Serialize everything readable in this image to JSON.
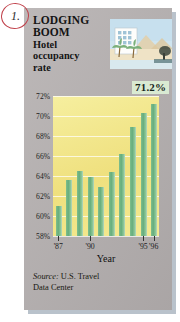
{
  "annotation": {
    "label": "1."
  },
  "headline": {
    "line1": "LODGING",
    "line2": "BOOM",
    "sub1": "Hotel",
    "sub2": "occupancy",
    "sub3": "rate"
  },
  "illustration": {
    "name": "hotel-beach-resort-illustration",
    "alt": "Hotel building with palm trees and beach"
  },
  "callout": {
    "value": "71.2%"
  },
  "source": {
    "prefix": "Source:",
    "line1": "U.S. Travel",
    "line2": "Data Center"
  },
  "colors": {
    "panel_background": "#b3aeae",
    "plot_background": "#f2e88c",
    "bar": "#66ad7c",
    "callout_background": "#d9ead2",
    "annotation": "#c0404a"
  },
  "chart_data": {
    "type": "bar",
    "title": "LODGING BOOM",
    "subtitle": "Hotel occupancy rate",
    "xlabel": "Year",
    "ylabel": "",
    "ylim": [
      58,
      72
    ],
    "grid": true,
    "legend": false,
    "source": "Source: U.S. Travel Data Center",
    "ytick_labels": [
      "72%",
      "70%",
      "68%",
      "66%",
      "64%",
      "62%",
      "60%",
      "58%"
    ],
    "ytick_values": [
      72,
      70,
      68,
      66,
      64,
      62,
      60,
      58
    ],
    "xtick_labels": [
      "'87",
      "'90",
      "'95",
      "'96"
    ],
    "xtick_indices": [
      0,
      3,
      8,
      9
    ],
    "categories": [
      "'87",
      "'88",
      "'89",
      "'90",
      "'91",
      "'92",
      "'93",
      "'94",
      "'95",
      "'96"
    ],
    "values": [
      61.0,
      63.6,
      64.5,
      63.9,
      62.9,
      64.4,
      66.2,
      68.9,
      70.3,
      71.2
    ],
    "annotations": [
      {
        "category": "'96",
        "value": 71.2,
        "label": "71.2%"
      }
    ]
  }
}
